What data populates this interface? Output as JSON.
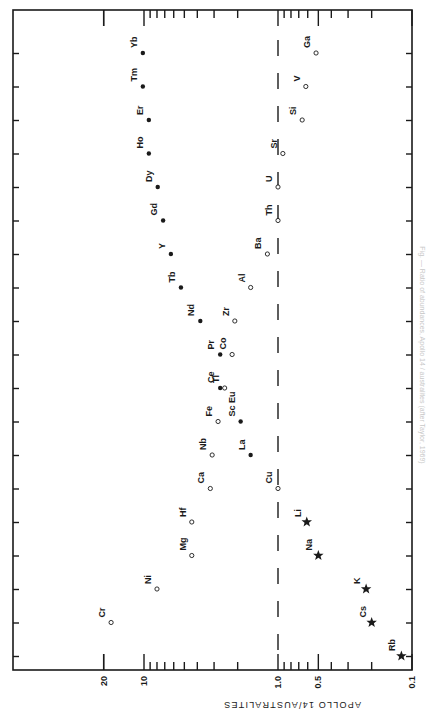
{
  "chart_data": {
    "type": "scatter",
    "orientation": "rotated-90-ccw",
    "title": "",
    "ylabel": "APOLLO 14/AUSTRALITES",
    "xlabel": "",
    "scale": "log",
    "ylim": [
      0.1,
      20
    ],
    "axis_ticks": [
      {
        "label": "20",
        "value": 20
      },
      {
        "label": "10",
        "value": 10
      },
      {
        "label": "1.0",
        "value": 1.0
      },
      {
        "label": "0.5",
        "value": 0.5
      },
      {
        "label": "0.1",
        "value": 0.1
      }
    ],
    "reference_line": {
      "value": 1.0,
      "style": "dashed"
    },
    "legend": [],
    "marker_types": {
      "filled": "filled circle",
      "open": "open circle",
      "star": "star"
    },
    "points": [
      {
        "element": "Yb",
        "value": 10.2,
        "marker": "filled",
        "row": 0
      },
      {
        "element": "Ga",
        "value": 0.52,
        "marker": "open",
        "row": 0
      },
      {
        "element": "Tm",
        "value": 10.2,
        "marker": "filled",
        "row": 1
      },
      {
        "element": "V",
        "value": 0.62,
        "marker": "open",
        "row": 1
      },
      {
        "element": "Er",
        "value": 9.2,
        "marker": "filled",
        "row": 2
      },
      {
        "element": "Si",
        "value": 0.66,
        "marker": "open",
        "row": 2
      },
      {
        "element": "Ho",
        "value": 9.2,
        "marker": "filled",
        "row": 3
      },
      {
        "element": "Sr",
        "value": 0.92,
        "marker": "open",
        "row": 3
      },
      {
        "element": "Dy",
        "value": 7.9,
        "marker": "filled",
        "row": 4
      },
      {
        "element": "U",
        "value": 1.0,
        "marker": "open",
        "row": 4
      },
      {
        "element": "Gd",
        "value": 7.2,
        "marker": "filled",
        "row": 5
      },
      {
        "element": "Th",
        "value": 1.0,
        "marker": "open",
        "row": 5
      },
      {
        "element": "Y",
        "value": 6.3,
        "marker": "filled",
        "row": 6
      },
      {
        "element": "Ba",
        "value": 1.2,
        "marker": "open",
        "row": 6
      },
      {
        "element": "Tb",
        "value": 5.3,
        "marker": "filled",
        "row": 7
      },
      {
        "element": "Al",
        "value": 1.6,
        "marker": "open",
        "row": 7
      },
      {
        "element": "Nd",
        "value": 3.8,
        "marker": "filled",
        "row": 8
      },
      {
        "element": "Zr",
        "value": 2.1,
        "marker": "open",
        "row": 8
      },
      {
        "element": "Pr",
        "value": 2.7,
        "marker": "filled",
        "row": 9
      },
      {
        "element": "Co",
        "value": 2.2,
        "marker": "open",
        "row": 9
      },
      {
        "element": "Ce",
        "value": 2.7,
        "marker": "filled",
        "row": 10
      },
      {
        "element": "Tl",
        "value": 2.5,
        "marker": "open",
        "row": 10
      },
      {
        "element": "Fe",
        "value": 2.8,
        "marker": "open",
        "row": 11
      },
      {
        "element": "Sc Eu",
        "value": 1.9,
        "marker": "filled",
        "row": 11
      },
      {
        "element": "Nb",
        "value": 3.1,
        "marker": "open",
        "row": 12
      },
      {
        "element": "La",
        "value": 1.6,
        "marker": "filled",
        "row": 12
      },
      {
        "element": "Ca",
        "value": 3.2,
        "marker": "open",
        "row": 13
      },
      {
        "element": "Cu",
        "value": 1.0,
        "marker": "open",
        "row": 13
      },
      {
        "element": "Hf",
        "value": 4.4,
        "marker": "open",
        "row": 14
      },
      {
        "element": "Li",
        "value": 0.61,
        "marker": "star",
        "row": 14
      },
      {
        "element": "Mg",
        "value": 4.4,
        "marker": "open",
        "row": 15
      },
      {
        "element": "Na",
        "value": 0.5,
        "marker": "star",
        "row": 15
      },
      {
        "element": "Ni",
        "value": 8.0,
        "marker": "open",
        "row": 16
      },
      {
        "element": "K",
        "value": 0.22,
        "marker": "star",
        "row": 16
      },
      {
        "element": "Cr",
        "value": 17.6,
        "marker": "open",
        "row": 17
      },
      {
        "element": "Cs",
        "value": 0.2,
        "marker": "star",
        "row": 17
      },
      {
        "element": "Rb",
        "value": 0.12,
        "marker": "star",
        "row": 18
      }
    ],
    "caption": "Fig. — Ratio of abundances, Apollo 14 / australites (after Taylor, 1969)"
  },
  "colors": {
    "ink": "#1a1a1a",
    "background": "#ffffff",
    "caption": "#c8c8c8"
  }
}
